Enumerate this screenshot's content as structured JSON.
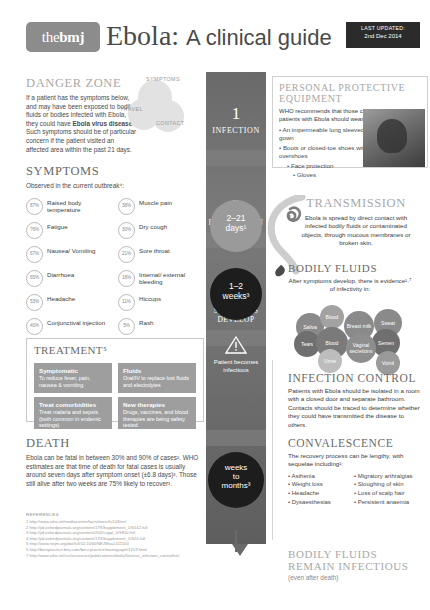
{
  "header": {
    "logo_the": "the",
    "logo_bmj": "bmj",
    "title_lead": "Ebola:",
    "title_sub": "A clinical guide",
    "updated_label": "LAST UPDATED:",
    "updated_date": "2nd Dec 2014"
  },
  "danger_zone": {
    "heading": "DANGER ZONE",
    "body_1": "If a patient has the symptoms below, and may have been exposed to bodily fluids or bodies infected with Ebola, they could have ",
    "body_bold": "Ebola virus disease",
    "body_2": ". Such symptoms should be of particular concern if the patient visited an affected area within the past 21 days.",
    "bubbles": [
      "SYMPTOMS",
      "TRAVEL",
      "CONTACT"
    ]
  },
  "symptoms": {
    "heading": "SYMPTOMS",
    "subheading": "Observed in the current outbreak⁴:",
    "items_left": [
      {
        "pct": "87%",
        "label": "Raised body temperature"
      },
      {
        "pct": "76%",
        "label": "Fatigue"
      },
      {
        "pct": "67%",
        "label": "Nausea/ Vomiting"
      },
      {
        "pct": "65%",
        "label": "Diarrhoea"
      },
      {
        "pct": "53%",
        "label": "Headache"
      },
      {
        "pct": "40%",
        "label": "Conjunctival injection"
      }
    ],
    "items_right": [
      {
        "pct": "38%",
        "label": "Muscle pain"
      },
      {
        "pct": "30%",
        "label": "Dry cough"
      },
      {
        "pct": "21%",
        "label": "Sore throat"
      },
      {
        "pct": "18%",
        "label": "Internal/ external bleeding"
      },
      {
        "pct": "11%",
        "label": "Hiccups"
      },
      {
        "pct": "5%",
        "label": "Rash"
      }
    ]
  },
  "treatment": {
    "heading": "TREATMENT⁵",
    "cells": [
      {
        "title": "Symptomatic",
        "body": "To reduce fever, pain, nausea & vomiting"
      },
      {
        "title": "Fluids",
        "body": "Oral/IV to replace lost fluids and electrolytes"
      },
      {
        "title": "Treat comorbidities",
        "body": "Treat malaria and sepsis (both common in endemic settings)"
      },
      {
        "title": "New therapies",
        "body": "Drugs, vaccines, and blood therapies are being safety tested"
      }
    ]
  },
  "death": {
    "heading": "DEATH",
    "body": "Ebola can be fatal in between 30% and 90% of cases². WHO estimates are that time of death for fatal cases is usually around seven days after symptom onset (±6.8 days)³. Those still alive after two weeks are 75% likely to recover³."
  },
  "references": {
    "heading": "REFERENCES",
    "items": [
      "1 http://www.who.int/mediacentre/factsheets/fs103/en/",
      "2 http://jid.oxfordjournals.org/content/179/Supplement_1/S142.full",
      "3 http://jid.oxfordjournals.org/content/204/suppl_3/S810.full",
      "4 http://jid.oxfordjournals.org/content/179/Supplement_1/S24.full",
      "5 http://www.nejm.org/doi/full/10.1056/NEJMoa1411100",
      "6 http://bestpractice.bmj.com/best-practice/monograph/1219.html",
      "7 http://www.who.int/csr/resources/publications/ebola/filovirus_infection_control/en/"
    ]
  },
  "spine": {
    "stages": [
      {
        "num": "1",
        "label": "INFECTION"
      },
      {
        "num": "2",
        "label": "INCUBATION"
      },
      {
        "num": "3",
        "label": "SYMPTOMS DEVELOP"
      },
      {
        "num": "4",
        "label": "OUTCOMES"
      }
    ],
    "pills": [
      {
        "line1": "2–21",
        "line2": "days¹"
      },
      {
        "line1": "1–2",
        "line2": "weeks³"
      },
      {
        "line1": "weeks",
        "line2": "to",
        "line3": "months³"
      }
    ],
    "infectious_note": "Patient becomes infectious",
    "warning_icon": "warning-triangle-icon"
  },
  "ppe": {
    "heading_1": "PERSONAL PROTECTIVE",
    "heading_2": "EQUIPMENT",
    "intro": "WHO recommends that those caring for patients with Ebola should wear⁷:",
    "items": [
      "An impermeable long sleeved gown",
      "Boots or closed-toe shoes with overshoes",
      "Face protection",
      "Gloves"
    ]
  },
  "transmission": {
    "heading": "TRANSMISSION",
    "body": "Ebola is spread by direct contact with infected bodily fluids or contaminated objects, through mucous membranes or broken skin."
  },
  "bodily_fluids": {
    "heading": "BODILY FLUIDS",
    "intro": "After symptoms develop, there is evidence¹˒⁷ of infectivity in:",
    "items": [
      "Saliva",
      "Blood",
      "Breast milk",
      "Sweat",
      "Tears",
      "Blood",
      "Semen",
      "Vaginal secretions",
      "Urine",
      "Vomit"
    ]
  },
  "infection_control": {
    "heading": "INFECTION CONTROL",
    "body": "Patients with Ebola should be isolated in a room with a closed door and separate bathroom. Contacts should be traced to determine whether they could have transmitted the disease to others."
  },
  "convalescence": {
    "heading": "CONVALESCENCE",
    "intro": "The recovery process can be lengthy, with sequelae including¹:",
    "left": [
      "Asthenia",
      "Weight loss",
      "Headache",
      "Dysaesthesias"
    ],
    "right": [
      "Migratory arthralgias",
      "Sloughing of skin",
      "Loss of scalp hair",
      "Persistent anaemia"
    ]
  },
  "footer": {
    "line1": "BODILY FLUIDS",
    "line2": "REMAIN INFECTIOUS",
    "line3": "(even after death)"
  },
  "colors": {
    "spine": "#6e6e6e",
    "accent_grey": "#9a9a9a",
    "dark": "#1d1d1d"
  }
}
